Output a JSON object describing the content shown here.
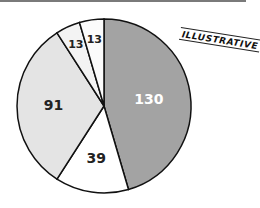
{
  "stamp": {
    "text": "ILLUSTRATIVE"
  },
  "chart_data": {
    "type": "pie",
    "title": "",
    "start_angle_deg": 0,
    "direction": "clockwise",
    "legend": "none",
    "slices": [
      {
        "label": "130",
        "value": 130,
        "color": "#a3a3a3",
        "text_color": "#ffffff"
      },
      {
        "label": "39",
        "value": 39,
        "color": "#ffffff",
        "text_color": "#222222"
      },
      {
        "label": "91",
        "value": 91,
        "color": "#e4e4e4",
        "text_color": "#222222"
      },
      {
        "label": "13",
        "value": 13,
        "color": "#f3f3f3",
        "text_color": "#222222"
      },
      {
        "label": "13",
        "value": 13,
        "color": "#fbfbfb",
        "text_color": "#222222"
      }
    ],
    "total": 286
  },
  "layout": {
    "cx": 104,
    "cy": 106,
    "r": 87
  }
}
